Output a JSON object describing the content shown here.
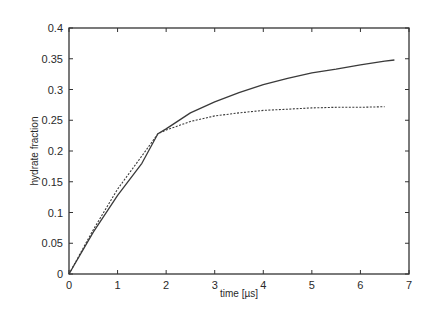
{
  "chart_data": {
    "type": "line",
    "title": "",
    "xlabel": "time [µs]",
    "ylabel": "hydrate fraction",
    "xlim": [
      0,
      7
    ],
    "ylim": [
      0,
      0.4
    ],
    "xticks": [
      "0",
      "1",
      "2",
      "3",
      "4",
      "5",
      "6",
      "7"
    ],
    "yticks": [
      "0",
      "0.05",
      "0.1",
      "0.15",
      "0.2",
      "0.25",
      "0.3",
      "0.35",
      "0.4"
    ],
    "grid": false,
    "legend": null,
    "series": [
      {
        "name": "solid",
        "style": "solid",
        "x": [
          0,
          0.5,
          1.0,
          1.5,
          1.83,
          2.0,
          2.5,
          3.0,
          3.5,
          4.0,
          4.5,
          5.0,
          5.5,
          6.0,
          6.5,
          6.7
        ],
        "y": [
          0,
          0.068,
          0.128,
          0.18,
          0.228,
          0.236,
          0.262,
          0.28,
          0.295,
          0.308,
          0.318,
          0.327,
          0.333,
          0.34,
          0.346,
          0.348
        ]
      },
      {
        "name": "dashed",
        "style": "dashed",
        "x": [
          0,
          0.5,
          1.0,
          1.5,
          1.83,
          2.0,
          2.5,
          3.0,
          3.5,
          4.0,
          4.5,
          5.0,
          5.5,
          6.0,
          6.5
        ],
        "y": [
          0,
          0.072,
          0.138,
          0.192,
          0.228,
          0.234,
          0.248,
          0.257,
          0.262,
          0.266,
          0.268,
          0.27,
          0.271,
          0.271,
          0.272
        ]
      }
    ]
  }
}
